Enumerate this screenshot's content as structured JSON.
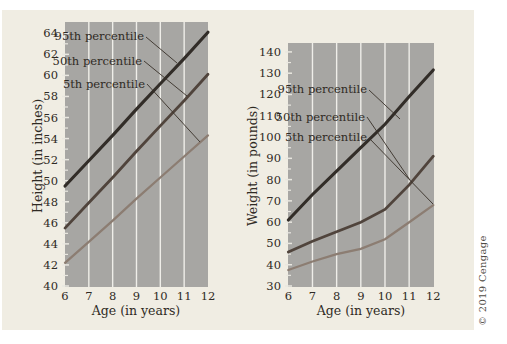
{
  "figure": {
    "copyright": "© 2019 Cengage",
    "background_color": "#ffffff",
    "mat_color": "#f0ede3",
    "panel_color": "#a7a6a3",
    "gridline_color": "#efeee9",
    "tick_color": "#e9e7e0",
    "text_color": "#2f2a24",
    "callout_color": "#383028"
  },
  "chart_data": [
    {
      "type": "line",
      "title": "",
      "xlabel": "Age (in years)",
      "ylabel": "Height (in inches)",
      "x": [
        6,
        7,
        8,
        9,
        10,
        11,
        12
      ],
      "xlim": [
        6,
        12
      ],
      "ylim": [
        40,
        65
      ],
      "grid_x": [
        7,
        8,
        9,
        10,
        11
      ],
      "yticks_major": [
        40,
        42,
        44,
        46,
        48,
        50,
        52,
        54,
        56,
        58,
        60,
        62,
        64
      ],
      "ytick_minor_step": 1,
      "legend_position": "inline-callout-labels",
      "grid": "vertical-white-lines",
      "series": [
        {
          "name": "95th percentile",
          "color": "#322d28",
          "width": 3.1,
          "values": [
            49.5,
            51.9,
            54.3,
            56.8,
            59.2,
            61.6,
            64.1
          ]
        },
        {
          "name": "50th percentile",
          "color": "#50443c",
          "width": 2.8,
          "values": [
            45.5,
            47.9,
            50.3,
            52.8,
            55.2,
            57.6,
            60.1
          ]
        },
        {
          "name": "5th percentile",
          "color": "#8c7d72",
          "width": 2.3,
          "values": [
            42.2,
            44.2,
            46.2,
            48.3,
            50.3,
            52.3,
            54.3
          ]
        }
      ]
    },
    {
      "type": "line",
      "title": "",
      "xlabel": "Age (in years)",
      "ylabel": "Weight (in pounds)",
      "x": [
        6,
        7,
        8,
        9,
        10,
        11,
        12
      ],
      "xlim": [
        6,
        12
      ],
      "ylim": [
        30,
        145
      ],
      "grid_x": [
        7,
        8,
        9,
        10,
        11
      ],
      "yticks_major": [
        30,
        40,
        50,
        60,
        70,
        80,
        90,
        100,
        110,
        120,
        130,
        140
      ],
      "ytick_minor_step": 5,
      "legend_position": "inline-callout-labels",
      "grid": "vertical-white-lines",
      "series": [
        {
          "name": "95th percentile",
          "color": "#322d28",
          "width": 3.1,
          "values": [
            61,
            73,
            84,
            95,
            106,
            119,
            131.5
          ]
        },
        {
          "name": "50th percentile",
          "color": "#50443c",
          "width": 2.8,
          "values": [
            46,
            51,
            55.5,
            60,
            66,
            77.5,
            91
          ]
        },
        {
          "name": "5th percentile",
          "color": "#8c7d72",
          "width": 2.3,
          "values": [
            37.5,
            41.5,
            45,
            47.5,
            52,
            60,
            68
          ]
        }
      ]
    }
  ]
}
